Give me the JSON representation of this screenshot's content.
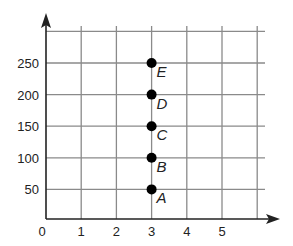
{
  "chart_data": {
    "type": "scatter",
    "title": "",
    "xlabel": "",
    "ylabel": "",
    "x_ticks": [
      "0",
      "1",
      "2",
      "3",
      "4",
      "5"
    ],
    "y_ticks": [
      "50",
      "100",
      "150",
      "200",
      "250"
    ],
    "xlim": [
      0,
      6
    ],
    "ylim": [
      0,
      300
    ],
    "grid": true,
    "legend": null,
    "points": [
      {
        "label": "A",
        "x": 3,
        "y": 50
      },
      {
        "label": "B",
        "x": 3,
        "y": 100
      },
      {
        "label": "C",
        "x": 3,
        "y": 150
      },
      {
        "label": "D",
        "x": 3,
        "y": 200
      },
      {
        "label": "E",
        "x": 3,
        "y": 250
      }
    ],
    "colors": {
      "points": "#000000",
      "grid": "#8a8a8a",
      "axes": "#222222"
    }
  }
}
